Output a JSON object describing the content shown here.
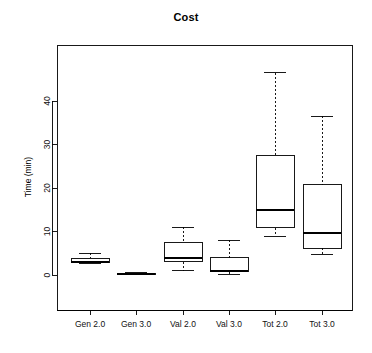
{
  "chart_data": {
    "type": "box",
    "title": "Cost",
    "xlabel": "",
    "ylabel": "Time (min)",
    "categories": [
      "Gen 2.0",
      "Gen 3.0",
      "Val 2.0",
      "Val 3.0",
      "Tot 2.0",
      "Tot 3.0"
    ],
    "ylim": [
      -1.5,
      48.5
    ],
    "yticks": [
      0,
      10,
      20,
      30,
      40
    ],
    "ytick_labels": [
      "0",
      "10",
      "20",
      "30",
      "40"
    ],
    "grid": false,
    "legend": null,
    "box_color": "#000000",
    "background": "#ffffff",
    "boxes": [
      {
        "label": "Gen 2.0",
        "whisker_low": 2.7,
        "q1": 2.8,
        "median": 3.0,
        "q3": 3.9,
        "whisker_high": 5.0,
        "outliers": []
      },
      {
        "label": "Gen 3.0",
        "whisker_low": 0.1,
        "q1": 0.15,
        "median": 0.3,
        "q3": 0.4,
        "whisker_high": 0.5,
        "outliers": []
      },
      {
        "label": "Val 2.0",
        "whisker_low": 1.0,
        "q1": 3.0,
        "median": 4.0,
        "q3": 7.4,
        "whisker_high": 11.0,
        "outliers": []
      },
      {
        "label": "Val 3.0",
        "whisker_low": 0.2,
        "q1": 0.7,
        "median": 0.9,
        "q3": 4.0,
        "whisker_high": 8.0,
        "outliers": []
      },
      {
        "label": "Tot 2.0",
        "whisker_low": 8.9,
        "q1": 10.9,
        "median": 15.0,
        "q3": 27.5,
        "whisker_high": 46.5,
        "outliers": []
      },
      {
        "label": "Tot 3.0",
        "whisker_low": 4.6,
        "q1": 6.2,
        "median": 9.7,
        "q3": 20.8,
        "whisker_high": 36.5,
        "outliers": []
      }
    ]
  }
}
